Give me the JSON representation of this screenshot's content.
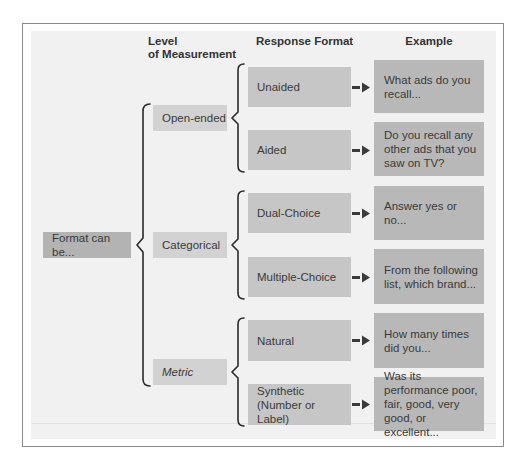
{
  "headers": {
    "level": "Level\nof Measurement",
    "level_line1": "Level",
    "level_line2": "of Measurement",
    "response": "Response Format",
    "example": "Example"
  },
  "root": {
    "label": "Format can be..."
  },
  "levels": [
    {
      "label": "Open-ended",
      "responses": [
        {
          "label": "Unaided",
          "example": "What ads do you recall..."
        },
        {
          "label": "Aided",
          "example": "Do you recall any other ads that you saw on TV?"
        }
      ]
    },
    {
      "label": "Categorical",
      "responses": [
        {
          "label": "Dual-Choice",
          "example": "Answer yes or no..."
        },
        {
          "label": "Multiple-Choice",
          "example": "From the following list, which brand..."
        }
      ]
    },
    {
      "label": "Metric",
      "responses": [
        {
          "label": "Natural",
          "example": "How many times did you..."
        },
        {
          "label": "Synthetic (Number or Label)",
          "example": "Was its performance poor, fair, good, very good, or excellent..."
        }
      ]
    }
  ],
  "colors": {
    "root_box": "#b3b3b3",
    "level_box": "#d2d2d2",
    "response_box": "#c6c6c6",
    "example_box": "#b8b8b8",
    "panel": "#f1f1f1",
    "brace": "#2a2a2a"
  }
}
